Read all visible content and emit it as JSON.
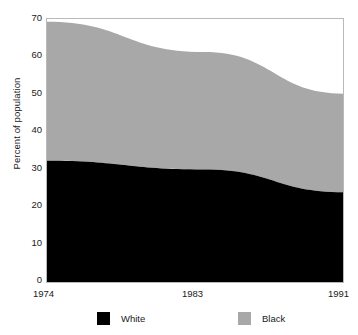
{
  "chart_data": {
    "type": "area",
    "stacked": true,
    "title": "",
    "xlabel": "",
    "ylabel": "Percent of population",
    "x": [
      1974,
      1983,
      1991
    ],
    "categories": [
      "1974",
      "1983",
      "1991"
    ],
    "xtick_labels": [
      "1974",
      "1983",
      "1991"
    ],
    "ytick_labels": [
      "0",
      "10",
      "20",
      "30",
      "40",
      "50",
      "60",
      "70"
    ],
    "ytick_values": [
      0,
      10,
      20,
      30,
      40,
      50,
      60,
      70
    ],
    "ylim": [
      0,
      70
    ],
    "xlim": [
      1974,
      1991
    ],
    "grid": false,
    "legend_position": "bottom",
    "series": [
      {
        "name": "White",
        "color": "#000000",
        "values": [
          32.3,
          30.0,
          24.0
        ]
      },
      {
        "name": "Black",
        "color": "#a8a8a8",
        "values": [
          36.7,
          31.0,
          26.0
        ]
      }
    ],
    "cumulative_totals": [
      69.0,
      61.0,
      50.0
    ],
    "legend": [
      {
        "label": "White",
        "swatch_color": "#000000"
      },
      {
        "label": "Black",
        "swatch_color": "#a8a8a8"
      }
    ],
    "colors": {
      "white_series": "#000000",
      "black_series": "#a8a8a8",
      "axis_text": "#1a1a1a",
      "plot_border": "#b9b9b9",
      "background": "#ffffff"
    }
  }
}
